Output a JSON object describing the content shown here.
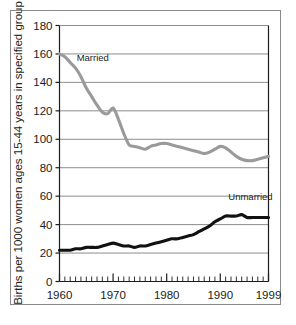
{
  "chart_data": {
    "type": "line",
    "title": "",
    "xlabel": "",
    "ylabel": "Births per 1000 women ages 15-44 years in specified group",
    "xlim": [
      1960,
      1999
    ],
    "ylim": [
      0,
      180
    ],
    "ytick_labels": [
      "0",
      "20",
      "40",
      "60",
      "80",
      "100",
      "120",
      "140",
      "160",
      "180"
    ],
    "yticks": [
      0,
      20,
      40,
      60,
      80,
      100,
      120,
      140,
      160,
      180
    ],
    "xtick_labels": [
      "1960",
      "1970",
      "1980",
      "1990",
      "1999"
    ],
    "xticks": [
      1960,
      1970,
      1980,
      1990,
      1999
    ],
    "minor_xtick_interval": 1,
    "grid": "horizontal",
    "legend_position": "inline-annotations",
    "annotations": [
      {
        "text": "Married",
        "x": 1963.2,
        "y": 155
      },
      {
        "text": "Unmarried",
        "x": 1991.5,
        "y": 57
      }
    ],
    "x": [
      1960,
      1961,
      1962,
      1963,
      1964,
      1965,
      1966,
      1967,
      1968,
      1969,
      1970,
      1971,
      1972,
      1973,
      1974,
      1975,
      1976,
      1977,
      1978,
      1979,
      1980,
      1981,
      1982,
      1983,
      1984,
      1985,
      1986,
      1987,
      1988,
      1989,
      1990,
      1991,
      1992,
      1993,
      1994,
      1995,
      1996,
      1997,
      1998,
      1999
    ],
    "series": [
      {
        "name": "Married",
        "color": "#9a9a9a",
        "values": [
          160,
          158,
          154,
          150,
          144,
          136,
          130,
          124,
          119,
          118,
          122,
          114,
          104,
          96,
          95,
          94,
          93,
          95,
          96,
          97,
          97,
          96,
          95,
          94,
          93,
          92,
          91,
          90,
          91,
          93,
          95,
          94,
          91,
          88,
          86,
          85,
          85,
          86,
          87,
          88
        ]
      },
      {
        "name": "Unmarried",
        "color": "#111111",
        "values": [
          22,
          22,
          22,
          23,
          23,
          24,
          24,
          24,
          25,
          26,
          27,
          26,
          25,
          25,
          24,
          25,
          25,
          26,
          27,
          28,
          29,
          30,
          30,
          31,
          32,
          33,
          35,
          37,
          39,
          42,
          44,
          46,
          46,
          46,
          47,
          45,
          45,
          45,
          45,
          45
        ]
      }
    ]
  },
  "figure": {
    "frame_color": "#8a8a8a",
    "grid_color": "#8c8c8c",
    "axis_color": "#1c1c1c",
    "background": "#ffffff"
  }
}
